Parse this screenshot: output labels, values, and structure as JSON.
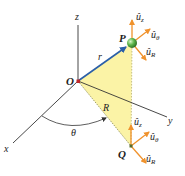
{
  "figure": {
    "axes": {
      "x": "x",
      "y": "y",
      "z": "z"
    },
    "origin_label": "O",
    "point_p_label": "P",
    "point_q_label": "Q",
    "position_vector_label": "r⃗",
    "radius_label": "R",
    "angle_label": "θ",
    "unit_vectors_p": {
      "z": "û",
      "z_sub": "z",
      "theta": "û",
      "theta_sub": "θ",
      "r": "û",
      "r_sub": "R"
    },
    "unit_vectors_q": {
      "z": "û",
      "z_sub": "z",
      "theta": "û",
      "theta_sub": "θ",
      "r": "û",
      "r_sub": "R"
    },
    "colors": {
      "triangle_fill": "#fbf3a6",
      "vector_r": "#2a5fa8",
      "unit_vector": "#f0922c",
      "point_p": "#4aa04a",
      "origin": "#c0282a",
      "axis": "#333333"
    }
  }
}
